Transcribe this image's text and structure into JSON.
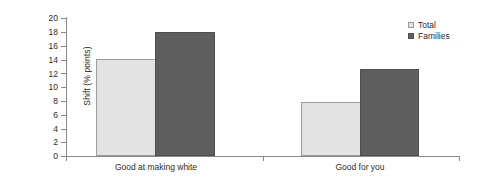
{
  "chart_data": {
    "type": "bar",
    "title": "",
    "xlabel": "",
    "ylabel": "Shift (% points)",
    "categories": [
      "Good at making white",
      "Good for you"
    ],
    "series": [
      {
        "name": "Total",
        "values": [
          14.0,
          7.8
        ],
        "color": "#e3e3e3"
      },
      {
        "name": "Families",
        "values": [
          18.0,
          12.6
        ],
        "color": "#5e5e5e"
      }
    ],
    "ylim": [
      0,
      20
    ],
    "ytick_step": 2,
    "ytick_labels": [
      "20",
      "18",
      "16",
      "14",
      "12",
      "10",
      "8",
      "6",
      "4",
      "2",
      "0"
    ],
    "grid": false,
    "legend_position": "top-right",
    "annotations": []
  },
  "legend": {
    "entries": [
      {
        "label": "Total"
      },
      {
        "label": "Families"
      }
    ]
  },
  "axes": {
    "y_title": "Shift (% points)"
  }
}
